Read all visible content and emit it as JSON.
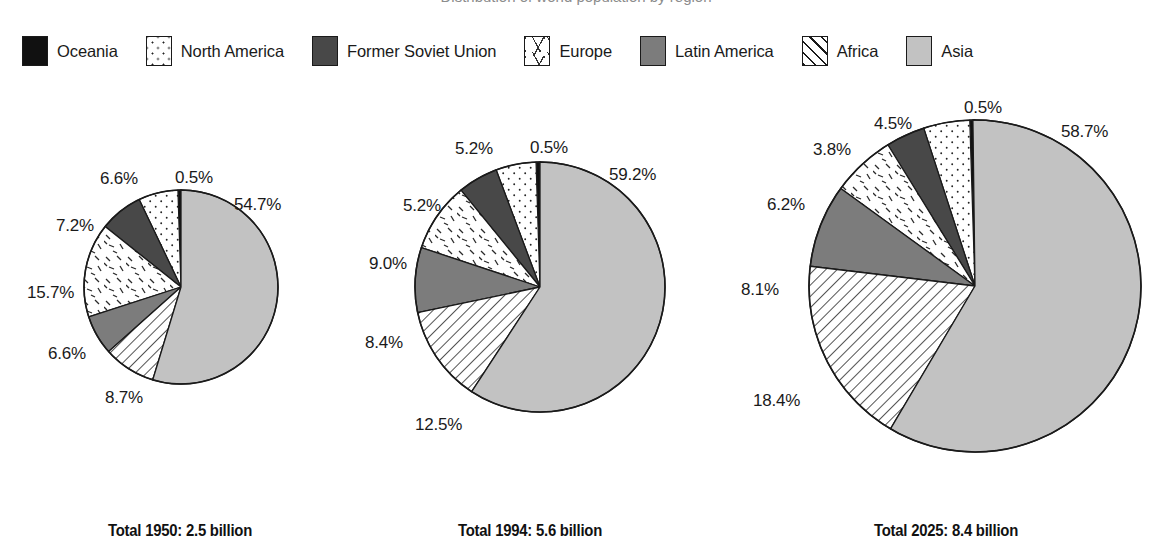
{
  "title": {
    "text": "Distribution of world population by region"
  },
  "legend": {
    "items": [
      {
        "label": "Oceania",
        "pattern": "fill-oceania",
        "icon": "swatch-solid-black-icon"
      },
      {
        "label": "North America",
        "pattern": "fill-northamerica",
        "icon": "swatch-dotted-icon"
      },
      {
        "label": "Former Soviet Union",
        "pattern": "fill-fsu",
        "icon": "swatch-dark-gray-icon"
      },
      {
        "label": "Europe",
        "pattern": "fill-europe",
        "icon": "swatch-dashes-icon"
      },
      {
        "label": "Latin America",
        "pattern": "fill-latinamerica",
        "icon": "swatch-medium-gray-icon"
      },
      {
        "label": "Africa",
        "pattern": "fill-africa",
        "icon": "swatch-diagonal-hatch-icon"
      },
      {
        "label": "Asia",
        "pattern": "fill-asia",
        "icon": "swatch-light-gray-icon"
      }
    ]
  },
  "colors": {
    "oceania": "#111111",
    "north_america": "#ffffff",
    "former_soviet_union": "#484848",
    "europe": "#ffffff",
    "latin_america": "#7c7c7c",
    "africa": "#ffffff",
    "asia": "#c2c2c2",
    "outline": "#1a1a1a",
    "background": "#ffffff"
  },
  "charts": [
    {
      "id": "chart-1950",
      "caption": "Total 1950: 2.5 billion",
      "year": "1950",
      "total": "2.5 billion",
      "radius": 97,
      "labels": [
        {
          "text": "0.5%",
          "x": 93,
          "y": -20
        },
        {
          "text": "54.7%",
          "x": 152,
          "y": 7
        },
        {
          "text": "8.7%",
          "x": 23,
          "y": 200
        },
        {
          "text": "6.6%",
          "x": -34,
          "y": 156
        },
        {
          "text": "15.7%",
          "x": -55,
          "y": 95
        },
        {
          "text": "7.2%",
          "x": -26,
          "y": 28
        },
        {
          "text": "6.6%",
          "x": 18,
          "y": -19
        }
      ]
    },
    {
      "id": "chart-1994",
      "caption": "Total 1994: 5.6 billion",
      "year": "1994",
      "total": "5.6 billion",
      "radius": 125,
      "labels": [
        {
          "text": "0.5%",
          "x": 117,
          "y": -22
        },
        {
          "text": "59.2%",
          "x": 196,
          "y": 5
        },
        {
          "text": "12.5%",
          "x": 2,
          "y": 255
        },
        {
          "text": "8.4%",
          "x": -48,
          "y": 173
        },
        {
          "text": "9.0%",
          "x": -44,
          "y": 94
        },
        {
          "text": "5.2%",
          "x": -10,
          "y": 36
        },
        {
          "text": "5.2%",
          "x": 42,
          "y": -21
        }
      ]
    },
    {
      "id": "chart-2025",
      "caption": "Total 2025: 8.4 billion",
      "year": "2025",
      "total": "8.4 billion",
      "radius": 166,
      "labels": [
        {
          "text": "0.5%",
          "x": 157,
          "y": -20
        },
        {
          "text": "58.7%",
          "x": 254,
          "y": 4
        },
        {
          "text": "18.4%",
          "x": -54,
          "y": 273
        },
        {
          "text": "8.1%",
          "x": -66,
          "y": 162
        },
        {
          "text": "6.2%",
          "x": -40,
          "y": 77
        },
        {
          "text": "3.8%",
          "x": 6,
          "y": 22
        },
        {
          "text": "4.5%",
          "x": 67,
          "y": -4
        }
      ]
    }
  ],
  "chart_data": {
    "type": "pie",
    "title": "Distribution of world population by region",
    "unit": "percent of world population",
    "categories": [
      "Oceania",
      "North America",
      "Former Soviet Union",
      "Europe",
      "Latin America",
      "Africa",
      "Asia"
    ],
    "legend_position": "top",
    "grid": false,
    "series": [
      {
        "name": "Total 1950: 2.5 billion",
        "total_population_billion": 2.5,
        "values": [
          0.5,
          6.6,
          7.2,
          15.7,
          6.6,
          8.7,
          54.7
        ]
      },
      {
        "name": "Total 1994: 5.6 billion",
        "total_population_billion": 5.6,
        "values": [
          0.5,
          5.2,
          5.2,
          9.0,
          8.4,
          12.5,
          59.2
        ]
      },
      {
        "name": "Total 2025: 8.4 billion",
        "total_population_billion": 8.4,
        "values": [
          0.5,
          4.5,
          3.8,
          6.2,
          8.1,
          18.4,
          58.7
        ]
      }
    ]
  }
}
